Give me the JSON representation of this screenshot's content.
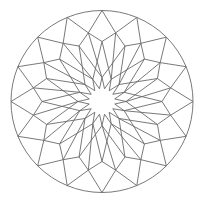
{
  "figure": {
    "title": "",
    "width": 203,
    "height": 204,
    "background": "#ffffff",
    "stroke_color": "#6a6a6a",
    "stroke_width": 0.9
  },
  "geometry": {
    "center": [
      102,
      101.5
    ],
    "symmetry": 16,
    "outer_circle_radius": 91,
    "outer_vertex_radius": 91,
    "ring_b_radius": 70,
    "ring_c_radius": 60,
    "star_tip_radius": 24,
    "star_valley_radius": 13
  }
}
